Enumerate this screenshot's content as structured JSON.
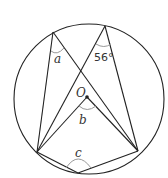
{
  "diagram": {
    "type": "circle-theorem",
    "center_label": "O",
    "labels": {
      "a": "a",
      "b": "b",
      "c": "c",
      "given_angle": "56°"
    },
    "points": {
      "top_left": [
        53,
        32
      ],
      "top_right": [
        105,
        26
      ],
      "left": [
        37,
        152
      ],
      "right": [
        138,
        151
      ],
      "bottom": [
        78,
        173
      ],
      "center": [
        87,
        97
      ]
    }
  }
}
